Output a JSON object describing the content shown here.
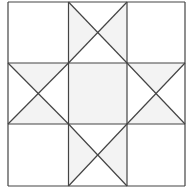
{
  "diagram": {
    "title": "",
    "pattern": "ohio-star-quilt-block",
    "grid": {
      "rows": 3,
      "cols": 3,
      "x_lines": [
        8,
        68.5,
        127,
        185
      ],
      "y_lines": [
        2,
        63,
        124,
        186
      ]
    },
    "colors": {
      "background": "#ffffff",
      "shaded": "#f3f3f3",
      "line": "#444444"
    }
  }
}
